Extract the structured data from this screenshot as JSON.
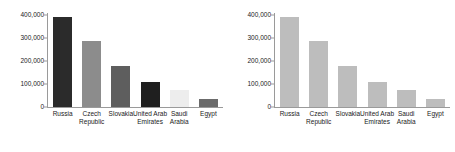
{
  "chart_data": [
    {
      "type": "bar",
      "panel": "left",
      "title": "",
      "xlabel": "",
      "ylabel": "",
      "categories": [
        "Russia",
        "Czech Republic",
        "Slovakia",
        "United Arab Emirates",
        "Saudi Arabia",
        "Egypt"
      ],
      "values": [
        390000,
        287000,
        178000,
        110000,
        75000,
        35000
      ],
      "colors": [
        "#2b2b2b",
        "#8c8c8c",
        "#5e5e5e",
        "#1f1f1f",
        "#ededed",
        "#6b6b6b"
      ],
      "ylim": [
        0,
        400000
      ],
      "yticks": [
        0,
        100000,
        200000,
        300000,
        400000
      ],
      "ytick_labels": [
        "0",
        "100,000",
        "200,000",
        "300,000",
        "400,000"
      ],
      "grid": false,
      "legend": "none"
    },
    {
      "type": "bar",
      "panel": "right",
      "title": "",
      "xlabel": "",
      "ylabel": "",
      "categories": [
        "Russia",
        "Czech Republic",
        "Slovakia",
        "United Arab Emirates",
        "Saudi Arabia",
        "Egypt"
      ],
      "values": [
        390000,
        287000,
        178000,
        110000,
        75000,
        35000
      ],
      "colors": [
        "#bdbdbd",
        "#bdbdbd",
        "#bdbdbd",
        "#bdbdbd",
        "#bdbdbd",
        "#bdbdbd"
      ],
      "ylim": [
        0,
        400000
      ],
      "yticks": [
        0,
        100000,
        200000,
        300000,
        400000
      ],
      "ytick_labels": [
        "0",
        "100,000",
        "200,000",
        "300,000",
        "400,000"
      ],
      "grid": false,
      "legend": "none"
    }
  ]
}
